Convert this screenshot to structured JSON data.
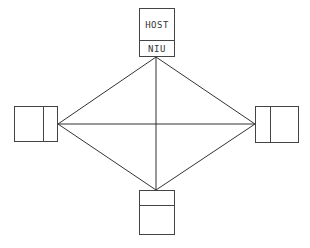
{
  "diagram": {
    "type": "network-topology",
    "nodes": {
      "top": {
        "upper_label": "HOST",
        "lower_label": "NIU"
      },
      "left": {
        "upper_label": "",
        "lower_label": ""
      },
      "right": {
        "upper_label": "",
        "lower_label": ""
      },
      "bottom": {
        "upper_label": "",
        "lower_label": ""
      }
    },
    "links": [
      {
        "from": "top",
        "to": "left"
      },
      {
        "from": "top",
        "to": "right"
      },
      {
        "from": "top",
        "to": "bottom"
      },
      {
        "from": "left",
        "to": "right"
      },
      {
        "from": "left",
        "to": "bottom"
      },
      {
        "from": "right",
        "to": "bottom"
      }
    ],
    "colors": {
      "line": "#333333",
      "background": "#ffffff"
    }
  }
}
